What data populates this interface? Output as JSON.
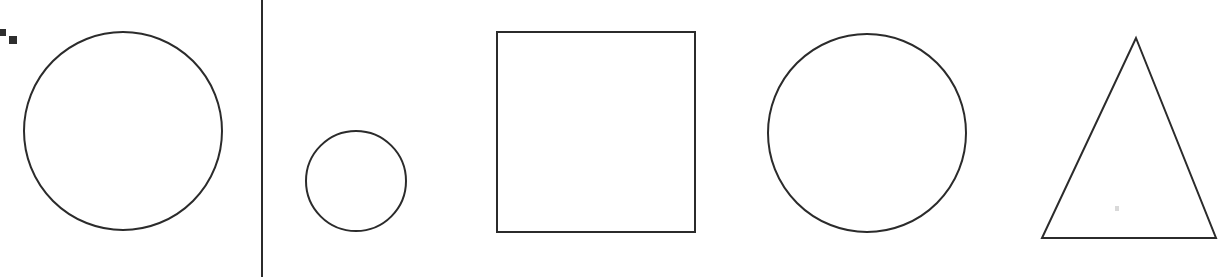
{
  "canvas": {
    "width": 1222,
    "height": 277,
    "background_color": "#ffffff",
    "stroke_color": "#2b2b2b",
    "marker_color": "#2e2e2e",
    "speck_color": "#d9d9d9"
  },
  "drawing": {
    "title": "Hand-drawn geometric shapes",
    "stroke_width": 2,
    "shape_count": 5,
    "shapes": [
      {
        "id": "circle-large-left",
        "kind": "circle",
        "label": "Large circle",
        "cx": 123,
        "cy": 131,
        "r": 99,
        "bbox": [
          25,
          31,
          197,
          199
        ]
      },
      {
        "id": "divider-line",
        "kind": "line",
        "label": "Vertical divider line",
        "x1": 262,
        "y1": 0,
        "x2": 262,
        "y2": 277
      },
      {
        "id": "circle-small",
        "kind": "circle",
        "label": "Small circle",
        "cx": 356,
        "cy": 181,
        "r": 50,
        "bbox": [
          306,
          131,
          100,
          100
        ]
      },
      {
        "id": "square",
        "kind": "square",
        "label": "Square",
        "x": 497,
        "y": 32,
        "width": 198,
        "height": 200
      },
      {
        "id": "circle-large-right",
        "kind": "circle",
        "label": "Large circle",
        "cx": 867,
        "cy": 133,
        "r": 99,
        "bbox": [
          768,
          34,
          198,
          198
        ]
      },
      {
        "id": "triangle",
        "kind": "triangle",
        "label": "Triangle",
        "points": [
          [
            1136,
            38
          ],
          [
            1216,
            238
          ],
          [
            1042,
            238
          ]
        ]
      }
    ],
    "markers": [
      {
        "id": "marker-a",
        "label": "Small dark square artifact",
        "x": 0,
        "y": 29,
        "width": 6,
        "height": 7
      },
      {
        "id": "marker-b",
        "label": "Small dark square artifact",
        "x": 9,
        "y": 36,
        "width": 8,
        "height": 8
      }
    ],
    "specks": [
      {
        "id": "speck-triangle",
        "label": "Faint speck inside triangle",
        "x": 1115,
        "y": 206
      }
    ]
  }
}
